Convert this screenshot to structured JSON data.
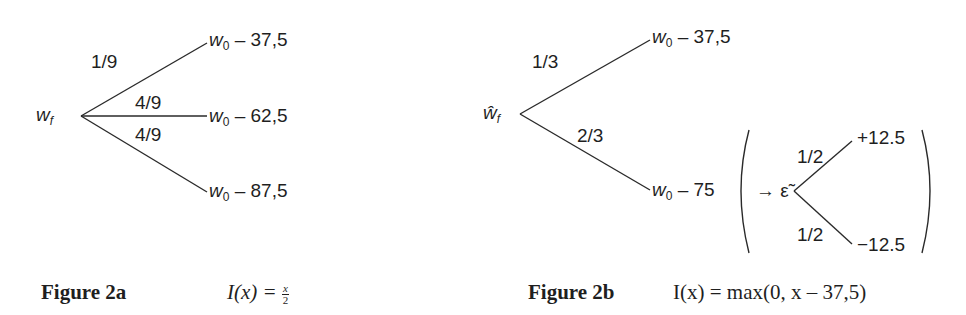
{
  "figure_a": {
    "root": {
      "symbol": "w",
      "subscript": "f"
    },
    "branches": [
      {
        "probability": "1/9",
        "leaf_base": "w",
        "leaf_sub": "0",
        "leaf_value": " – 37,5"
      },
      {
        "probability": "4/9",
        "leaf_base": "w",
        "leaf_sub": "0",
        "leaf_value": " – 62,5"
      },
      {
        "probability": "4/9",
        "leaf_base": "w",
        "leaf_sub": "0",
        "leaf_value": " – 87,5"
      }
    ],
    "caption": {
      "label": "Figure 2a",
      "formula_lhs": "I(x) = ",
      "frac_num": "x",
      "frac_den": "2"
    }
  },
  "figure_b": {
    "root": {
      "symbol": "ŵ",
      "subscript": "f"
    },
    "branches": [
      {
        "probability": "1/3",
        "leaf_base": "w",
        "leaf_sub": "0",
        "leaf_value": " – 37,5"
      },
      {
        "probability": "2/3",
        "leaf_base": "w",
        "leaf_sub": "0",
        "leaf_value": " – 75"
      }
    ],
    "noise": {
      "arrow": "→",
      "symbol": "ε̃",
      "branches": [
        {
          "probability": "1/2",
          "value": "+12.5"
        },
        {
          "probability": "1/2",
          "value": "−12.5"
        }
      ]
    },
    "caption": {
      "label": "Figure 2b",
      "formula": "I(x) = max(0, x – 37,5)"
    }
  },
  "colors": {
    "line": "#2a2a2a",
    "text": "#1f1f1f",
    "background": "#ffffff"
  }
}
